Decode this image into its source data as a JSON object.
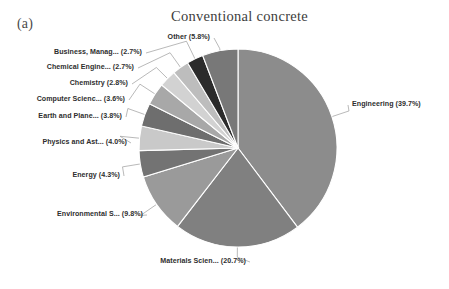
{
  "panel": {
    "label": "(a)"
  },
  "chart_data": {
    "type": "pie",
    "title": "Conventional concrete",
    "xlabel": "",
    "ylabel": "",
    "legend_position": "none",
    "grid": false,
    "labels_show_percent": true,
    "categories": [
      "Engineering",
      "Materials Scien...",
      "Environmental S...",
      "Energy",
      "Physics and Ast...",
      "Earth and Plane...",
      "Computer Scienc...",
      "Chemistry",
      "Chemical Engine...",
      "Business, Manag...",
      "Other"
    ],
    "values": [
      39.7,
      20.7,
      9.8,
      4.3,
      4.0,
      3.8,
      3.6,
      2.8,
      2.7,
      2.7,
      5.8
    ],
    "slice_labels": [
      "Engineering (39.7%)",
      "Materials Scien... (20.7%)",
      "Environmental S... (9.8%)",
      "Energy (4.3%)",
      "Physics and Ast... (4.0%)",
      "Earth and Plane... (3.8%)",
      "Computer Scienc... (3.6%)",
      "Chemistry (2.8%)",
      "Chemical Engine... (2.7%)",
      "Business, Manag... (2.7%)",
      "Other (5.8%)"
    ],
    "colors": [
      "#8c8c8c",
      "#808080",
      "#9a9a9a",
      "#737373",
      "#c9c9c9",
      "#6e6e6e",
      "#a8a8a8",
      "#d2d2d2",
      "#bdbdbd",
      "#2b2b2b",
      "#787878"
    ],
    "slice_edge_color": "#ffffff",
    "leader_line_color": "#9b9b9b",
    "label_text_color": "#2e2e2e",
    "title_color": "#3d3d3d",
    "background": "#ffffff"
  }
}
